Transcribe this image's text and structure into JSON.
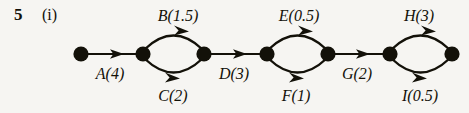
{
  "figure": {
    "question_number": "5",
    "part_label": "(i)",
    "type": "activity-network-diagram",
    "background_color": "#f6f5f2",
    "ink_color": "#131109"
  },
  "nodes": [
    {
      "id": "n1",
      "x": 81,
      "y": 54
    },
    {
      "id": "n2",
      "x": 143,
      "y": 54
    },
    {
      "id": "n3",
      "x": 204,
      "y": 54
    },
    {
      "id": "n4",
      "x": 267,
      "y": 54
    },
    {
      "id": "n5",
      "x": 328,
      "y": 54
    },
    {
      "id": "n6",
      "x": 390,
      "y": 54
    },
    {
      "id": "n7",
      "x": 452,
      "y": 54
    }
  ],
  "edges": [
    {
      "activity": "A",
      "duration": "4",
      "label": "A(4)",
      "from": "n1",
      "to": "n2",
      "shape": "straight",
      "label_x": 110,
      "label_y": 66
    },
    {
      "activity": "B",
      "duration": "1.5",
      "label": "B(1.5)",
      "from": "n2",
      "to": "n3",
      "shape": "arc-up",
      "label_x": 178,
      "label_y": 8
    },
    {
      "activity": "C",
      "duration": "2",
      "label": "C(2)",
      "from": "n2",
      "to": "n3",
      "shape": "arc-down",
      "label_x": 173,
      "label_y": 88
    },
    {
      "activity": "D",
      "duration": "3",
      "label": "D(3)",
      "from": "n3",
      "to": "n4",
      "shape": "straight",
      "label_x": 234,
      "label_y": 66
    },
    {
      "activity": "E",
      "duration": "0.5",
      "label": "E(0.5)",
      "from": "n4",
      "to": "n5",
      "shape": "arc-up",
      "label_x": 299,
      "label_y": 8
    },
    {
      "activity": "F",
      "duration": "1",
      "label": "F(1)",
      "from": "n4",
      "to": "n5",
      "shape": "arc-down",
      "label_x": 296,
      "label_y": 88
    },
    {
      "activity": "G",
      "duration": "2",
      "label": "G(2)",
      "from": "n5",
      "to": "n6",
      "shape": "straight",
      "label_x": 357,
      "label_y": 66
    },
    {
      "activity": "H",
      "duration": "3",
      "label": "H(3)",
      "from": "n6",
      "to": "n7",
      "shape": "arc-up",
      "label_x": 419,
      "label_y": 8
    },
    {
      "activity": "I",
      "duration": "0.5",
      "label": "I(0.5)",
      "from": "n6",
      "to": "n7",
      "shape": "arc-down",
      "label_x": 420,
      "label_y": 88
    }
  ]
}
